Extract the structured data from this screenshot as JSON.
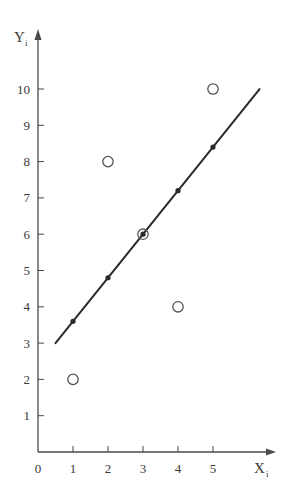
{
  "chart_data": {
    "type": "scatter",
    "title": "",
    "xlabel": "X",
    "xlabel_sub": "i",
    "ylabel": "Y",
    "ylabel_sub": "i",
    "xlim": [
      0,
      6.8
    ],
    "ylim": [
      0,
      11.4
    ],
    "grid": false,
    "legend": null,
    "x_ticks": [
      0,
      1,
      2,
      3,
      4,
      5
    ],
    "y_ticks": [
      1,
      2,
      3,
      4,
      5,
      6,
      7,
      8,
      9,
      10
    ],
    "series": [
      {
        "name": "observed",
        "marker": "open-circle",
        "x": [
          1,
          2,
          3,
          4,
          5
        ],
        "y": [
          2,
          8,
          6,
          4,
          10
        ]
      },
      {
        "name": "fitted",
        "marker": "filled-dot",
        "x": [
          1,
          2,
          3,
          4,
          5
        ],
        "y": [
          3.6,
          4.8,
          6.0,
          7.2,
          8.4
        ]
      }
    ],
    "regression_line": {
      "intercept": 2.4,
      "slope": 1.2,
      "x_start": 0.5,
      "x_end": 6.33
    }
  },
  "colors": {
    "ink": "#2a2a2a",
    "axis": "#4a4a4a",
    "marker_open": "#555555"
  }
}
